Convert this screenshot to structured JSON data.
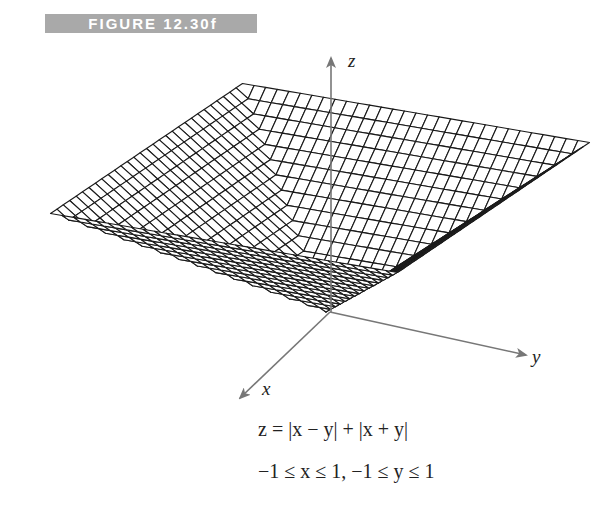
{
  "figure_label": "FIGURE 12.30f",
  "equation": "z = |x − y| + |x + y|",
  "domain_text": "−1 ≤ x ≤ 1, −1 ≤ y ≤ 1",
  "colors": {
    "mesh": "#1a1a1a",
    "axis": "#777777",
    "label_bg": "#a9a9a9",
    "label_fg": "#ffffff"
  },
  "chart_data": {
    "type": "surface-wireframe",
    "title": "FIGURE 12.30f",
    "function": "z = |x - y| + |x + y|",
    "x_range": [
      -1,
      1
    ],
    "y_range": [
      -1,
      1
    ],
    "z_range": [
      0,
      2
    ],
    "grid_divisions": 30,
    "axes": {
      "x": {
        "label": "x",
        "origin": [
          330,
          312
        ],
        "tip": [
          240,
          398
        ],
        "label_pos": [
          262,
          378
        ]
      },
      "y": {
        "label": "y",
        "origin": [
          330,
          312
        ],
        "tip": [
          526,
          355
        ],
        "label_pos": [
          532,
          346
        ]
      },
      "z": {
        "label": "z",
        "origin": [
          331,
          312
        ],
        "tip": [
          331,
          58
        ],
        "label_pos": [
          348,
          50
        ]
      }
    },
    "projection": {
      "origin": [
        326,
        312
      ],
      "ex": [
        -96,
        65
      ],
      "ey": [
        173.5,
        29.5
      ],
      "ez": [
        -3,
        -67
      ]
    },
    "annotations": [
      "z = |x − y| + |x + y|",
      "−1 ≤ x ≤ 1, −1 ≤ y ≤ 1"
    ]
  }
}
